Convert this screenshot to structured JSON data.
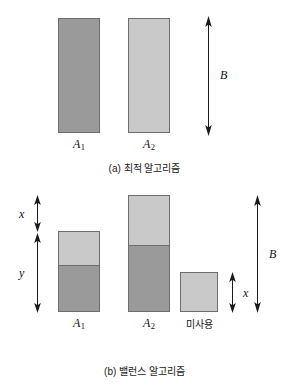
{
  "figure": {
    "panels": [
      {
        "id": "panel-a",
        "caption": "(a) 최적 알고리즘",
        "bars": [
          {
            "name": "A1",
            "label": "A",
            "subscript": "1",
            "segments": [
              {
                "shade": "dark",
                "fraction": 1.0
              }
            ]
          },
          {
            "name": "A2",
            "label": "A",
            "subscript": "2",
            "segments": [
              {
                "shade": "light",
                "fraction": 1.0
              }
            ]
          }
        ],
        "dimensions": [
          {
            "name": "B",
            "label": "B",
            "kind": "double-arrow"
          }
        ]
      },
      {
        "id": "panel-b",
        "caption": "(b) 밸런스 알고리즘",
        "bars": [
          {
            "name": "A1",
            "label": "A",
            "subscript": "1",
            "segments": [
              {
                "shade": "light",
                "fraction": 0.42
              },
              {
                "shade": "dark",
                "fraction": 0.58
              }
            ]
          },
          {
            "name": "A2",
            "label": "A",
            "subscript": "2",
            "segments": [
              {
                "shade": "light",
                "fraction": 0.43
              },
              {
                "shade": "dark",
                "fraction": 0.57
              }
            ]
          },
          {
            "name": "unused",
            "label": "미사용",
            "subscript": "",
            "segments": [
              {
                "shade": "light",
                "fraction": 1.0
              }
            ]
          }
        ],
        "dimensions": [
          {
            "name": "x-left",
            "label": "x",
            "kind": "double-arrow"
          },
          {
            "name": "y-left",
            "label": "y",
            "kind": "double-arrow"
          },
          {
            "name": "x-unused",
            "label": "x",
            "kind": "double-arrow"
          },
          {
            "name": "B",
            "label": "B",
            "kind": "double-arrow"
          }
        ]
      }
    ],
    "colors": {
      "dark_fill": "#9a9a9a",
      "light_fill": "#c9c9c9",
      "stroke": "#6e6e6e",
      "arrow": "#1a1a1a",
      "background": "#ffffff"
    }
  }
}
